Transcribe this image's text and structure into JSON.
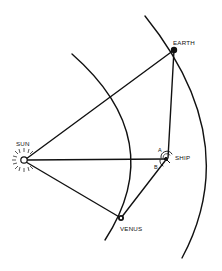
{
  "diagram": {
    "colors": {
      "ink": "#111111",
      "background": "#ffffff"
    },
    "bodies": {
      "sun": {
        "label": "SUN",
        "x": 24,
        "y": 160
      },
      "earth": {
        "label": "EARTH",
        "x": 174,
        "y": 50
      },
      "venus": {
        "label": "VENUS",
        "x": 121,
        "y": 218
      },
      "ship": {
        "label": "SHIP",
        "x": 166,
        "y": 159
      }
    },
    "angles": {
      "a": "A",
      "b": "B"
    },
    "orbits": [
      {
        "name": "venus-orbit",
        "path": "M72,54 Q170,140 105,240"
      },
      {
        "name": "earth-orbit",
        "path": "M145,16 Q245,140 182,258"
      }
    ],
    "lines": [
      {
        "name": "sun-earth-line",
        "from": "sun",
        "to": "earth"
      },
      {
        "name": "sun-ship-line",
        "from": "sun",
        "to": "ship"
      },
      {
        "name": "sun-venus-line",
        "from": "sun",
        "to": "venus"
      },
      {
        "name": "earth-ship-line",
        "from": "earth",
        "to": "ship"
      },
      {
        "name": "venus-ship-line",
        "from": "venus",
        "to": "ship"
      }
    ]
  }
}
